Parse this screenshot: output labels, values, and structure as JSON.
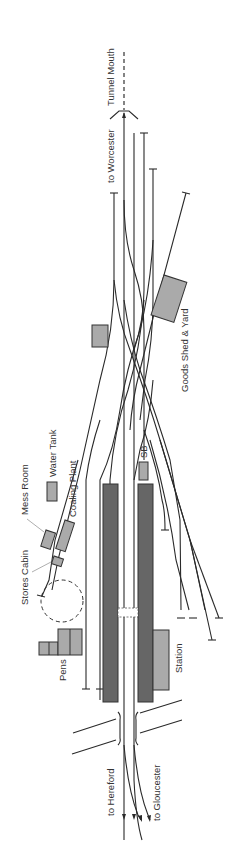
{
  "diagram": {
    "type": "railway-track-plan",
    "orientation": "rotated-90-ccw",
    "colors": {
      "background": "#ffffff",
      "track": "#2a2a2a",
      "platform": "#666666",
      "building": "#aaaaaa",
      "outline": "#333333",
      "label": "#333333"
    },
    "labels": {
      "tunnel_mouth": "Tunnel Mouth",
      "to_worcester": "to Worcester",
      "goods_shed": "Goods Shed & Yard",
      "sb": "SB",
      "water_tank": "Water Tank",
      "coaling_plant": "Coaling Plant",
      "mess_room": "Mess Room",
      "stores_cabin": "Stores Cabin",
      "pens": "Pens",
      "station": "Station",
      "to_hereford": "to Hereford",
      "to_gloucester": "to Gloucester"
    },
    "structures": [
      {
        "name": "Up platform",
        "kind": "platform"
      },
      {
        "name": "Down platform",
        "kind": "platform"
      },
      {
        "name": "Station building",
        "kind": "building"
      },
      {
        "name": "Signal box (SB)",
        "kind": "building"
      },
      {
        "name": "Goods shed",
        "kind": "building"
      },
      {
        "name": "Water tank",
        "kind": "building"
      },
      {
        "name": "Coaling plant",
        "kind": "building"
      },
      {
        "name": "Mess room",
        "kind": "building"
      },
      {
        "name": "Stores cabin",
        "kind": "building"
      },
      {
        "name": "Pens",
        "kind": "building"
      },
      {
        "name": "Turntable",
        "kind": "dashed-circle"
      },
      {
        "name": "Footbridge",
        "kind": "bridge"
      },
      {
        "name": "Road overbridge",
        "kind": "bridge"
      }
    ]
  }
}
